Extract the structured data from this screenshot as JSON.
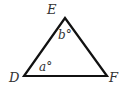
{
  "diagram": {
    "type": "triangle",
    "vertices": [
      {
        "label": "E",
        "x": 65,
        "y": 18
      },
      {
        "label": "D",
        "x": 24,
        "y": 76
      },
      {
        "label": "F",
        "x": 107,
        "y": 76
      }
    ],
    "angles": [
      {
        "vertex": "E",
        "label": "b°"
      },
      {
        "vertex": "D",
        "label": "a°"
      }
    ],
    "stroke_color": "#111111"
  }
}
